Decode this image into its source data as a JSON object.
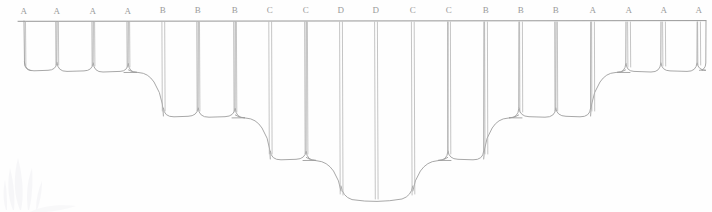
{
  "document": {
    "title": "Scalloped Valance Pattern Drawing",
    "medium": "pencil line drawing on white paper",
    "line_color": "#9e9e9e",
    "label_color": "#9a9a9a",
    "background_color": "#fefefe"
  },
  "diagram": {
    "kind": "scalloped-valance-elevation",
    "top_rail": {
      "y": 21,
      "x_start": 18,
      "x_end": 706
    },
    "deepest_point_y": 200,
    "panel_labels": [
      "A",
      "A",
      "A",
      "A",
      "B",
      "B",
      "B",
      "C",
      "C",
      "D",
      "D",
      "C",
      "C",
      "B",
      "B",
      "B",
      "A",
      "A",
      "A",
      "A"
    ],
    "label_y": 13,
    "seam_x": [
      24,
      57,
      93,
      128,
      163,
      198,
      235,
      270,
      306,
      341,
      376,
      413,
      449,
      486,
      521,
      556,
      593,
      629,
      664,
      699
    ],
    "levels": [
      {
        "label": "A",
        "bottom_y": 70,
        "count_per_side": 4
      },
      {
        "label": "B",
        "bottom_y": 115,
        "count_per_side": 3
      },
      {
        "label": "C",
        "bottom_y": 158,
        "count_per_side": 2
      },
      {
        "label": "D",
        "bottom_y": 200,
        "count_per_side": 1
      }
    ]
  },
  "watermark": {
    "present": true,
    "position": "bottom-left",
    "color": "#ededf2",
    "description": "very faint pale grey leaf / feather logo mark"
  }
}
